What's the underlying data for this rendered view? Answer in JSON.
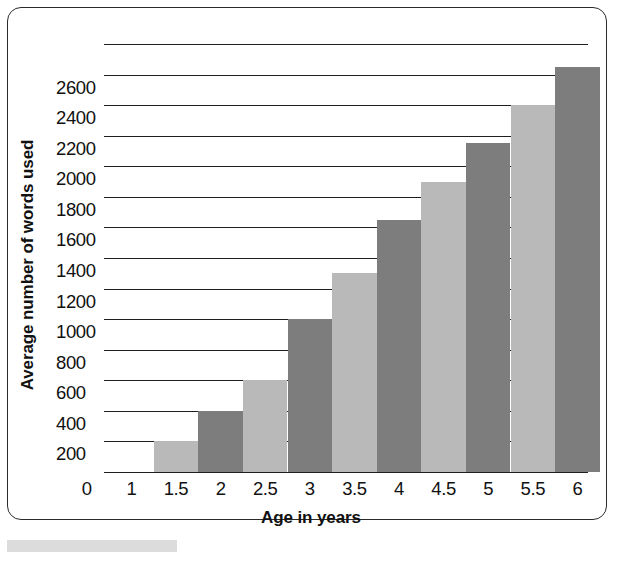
{
  "figure": {
    "frame_border_color": "#2a2a2a",
    "background_color": "#ffffff",
    "caption_strip_color": "#dcdcdc"
  },
  "chart_data": {
    "type": "bar",
    "title": "",
    "xlabel": "Age in years",
    "ylabel": "Average number of words used",
    "categories": [
      "1.5",
      "2",
      "2.5",
      "3",
      "3.5",
      "4",
      "4.5",
      "5",
      "5.5",
      "6"
    ],
    "values": [
      200,
      400,
      600,
      1000,
      1300,
      1650,
      1900,
      2150,
      2400,
      2650
    ],
    "x_tick_labels": [
      "0",
      "1",
      "1.5",
      "2",
      "2.5",
      "3",
      "3.5",
      "4",
      "4.5",
      "5",
      "5.5",
      "6"
    ],
    "y_tick_labels": [
      "200",
      "400",
      "600",
      "800",
      "1000",
      "1200",
      "1400",
      "1600",
      "1800",
      "2000",
      "2200",
      "2400",
      "2600"
    ],
    "ylim": [
      0,
      2800
    ],
    "y_tick_step": 200,
    "grid": true,
    "grid_color": "#1f1f1f",
    "legend": false,
    "bar_colors_alternating": [
      "#b9b9b9",
      "#7d7d7d"
    ],
    "series": [
      {
        "name": "Average number of words used",
        "values": [
          200,
          400,
          600,
          1000,
          1300,
          1650,
          1900,
          2150,
          2400,
          2650
        ]
      }
    ]
  }
}
